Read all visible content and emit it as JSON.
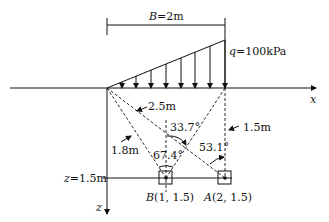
{
  "diagram": {
    "width_label_var": "B",
    "width_label_val": "=2m",
    "load_label_var": "q",
    "load_label_val": "=100kPa",
    "x_axis": "x",
    "z_axis": "z",
    "depth_label_var": "z",
    "depth_label_val": "=1.5m",
    "dist_25": "2.5m",
    "dist_18": "1.8m",
    "dist_15": "1.5m",
    "angle_337": "33.7°",
    "angle_674": "67.4°",
    "angle_531": "53.1°",
    "point_b_var": "B",
    "point_b_coords": "(1, 1.5)",
    "point_a_var": "A",
    "point_a_coords": "(2, 1.5)",
    "line_color": "#111111"
  }
}
